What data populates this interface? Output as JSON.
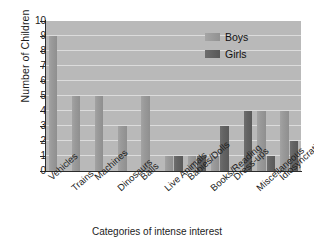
{
  "chart_data": {
    "type": "bar",
    "title": "",
    "xlabel": "Categories of intense interest",
    "ylabel": "Number of Children",
    "ylim": [
      0,
      10
    ],
    "ytick_values": [
      0,
      1,
      2,
      3,
      4,
      5,
      6,
      7,
      8,
      9,
      10
    ],
    "ytick_labels": [
      "0",
      "1",
      "2",
      "3",
      "4",
      "5",
      "6",
      "7",
      "8",
      "9",
      "10"
    ],
    "grid": true,
    "legend_position": "top-right-inside",
    "categories": [
      "Vehicles",
      "Trains",
      "Machines",
      "Dinosaurs",
      "Balls",
      "Live Animals",
      "Babies/Dolls",
      "Books/Reading",
      "Dress-ups",
      "Miscellaneous",
      "Idiosyncratic"
    ],
    "series": [
      {
        "name": "Boys",
        "color": "#9a9a9a",
        "values": [
          9,
          5,
          5,
          3,
          5,
          1,
          1,
          1,
          0,
          4,
          4
        ]
      },
      {
        "name": "Girls",
        "color": "#616161",
        "values": [
          0,
          0,
          0,
          0,
          0,
          1,
          1,
          3,
          4,
          1,
          2
        ]
      }
    ]
  },
  "legend": {
    "entries": [
      {
        "label": "Boys"
      },
      {
        "label": "Girls"
      }
    ]
  },
  "colors": {
    "plot_background": "#b9b9b9",
    "gridline": "#e2e2e2",
    "axis": "#2b2b2b",
    "boys_bar": "#9a9a9a",
    "girls_bar": "#616161",
    "text": "#1c1c1c"
  }
}
